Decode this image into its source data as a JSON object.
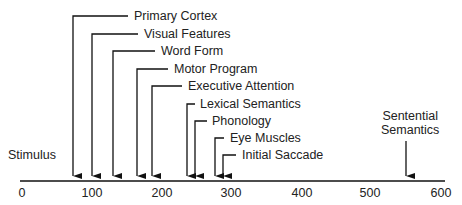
{
  "axis": {
    "min": 0,
    "max": 600,
    "ticks": [
      "0",
      "100",
      "200",
      "300",
      "400",
      "500",
      "600"
    ]
  },
  "left_label": "Stimulus",
  "events": [
    {
      "label": "Primary Cortex",
      "time": 70
    },
    {
      "label": "Visual Features",
      "time": 100
    },
    {
      "label": "Word Form",
      "time": 130
    },
    {
      "label": "Motor Program",
      "time": 165
    },
    {
      "label": "Executive Attention",
      "time": 187
    },
    {
      "label": "Lexical Semantics",
      "time": 237
    },
    {
      "label": "Phonology",
      "time": 247
    },
    {
      "label": "Eye Muscles",
      "time": 275
    },
    {
      "label": "Initial Saccade",
      "time": 287
    }
  ],
  "sentential": {
    "label_line1": "Sentential",
    "label_line2": "Semantics",
    "time": 550
  }
}
